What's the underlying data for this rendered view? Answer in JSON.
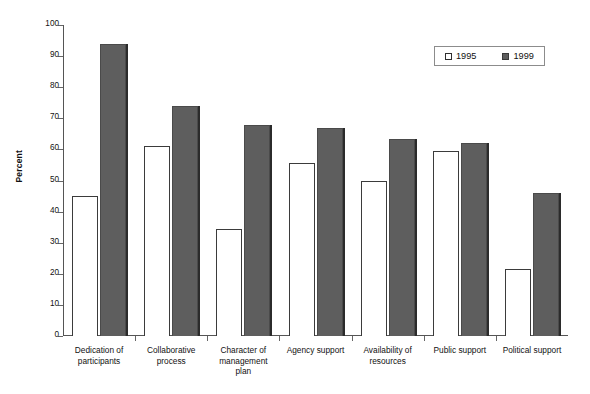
{
  "chart_data": {
    "type": "bar",
    "title": "",
    "xlabel": "",
    "ylabel": "Percent",
    "ylim": [
      0,
      100
    ],
    "ytick_step": 10,
    "yticks": [
      100,
      90,
      80,
      70,
      60,
      50,
      40,
      30,
      20,
      10,
      0
    ],
    "grid": false,
    "legend_position": "top-right",
    "categories": [
      "Dedication of participants",
      "Collaborative process",
      "Character of management plan",
      "Agency support",
      "Availability of resources",
      "Public support",
      "Political support"
    ],
    "category_lines": [
      [
        "Dedication of",
        "participants"
      ],
      [
        "Collaborative",
        "process"
      ],
      [
        "Character of",
        "management",
        "plan"
      ],
      [
        "Agency support"
      ],
      [
        "Availability of",
        "resources"
      ],
      [
        "Public support"
      ],
      [
        "Political support"
      ]
    ],
    "series": [
      {
        "name": "1995",
        "color": "#ffffff",
        "values": [
          45,
          61,
          34.5,
          55.5,
          50,
          59.5,
          21.5
        ]
      },
      {
        "name": "1999",
        "color": "#5e5e5e",
        "values": [
          94,
          74,
          68,
          67,
          63.5,
          62,
          46
        ]
      }
    ]
  },
  "legend": {
    "entries": [
      {
        "label": "1995",
        "swatch": "hollow-square"
      },
      {
        "label": "1999",
        "swatch": "filled-square"
      }
    ]
  },
  "axes": {
    "y_title": "Percent"
  },
  "colors": {
    "series_1995_fill": "#ffffff",
    "series_1999_fill": "#5e5e5e",
    "bar_outline": "#3b3b3b",
    "axis": "#555555",
    "text": "#111111"
  }
}
